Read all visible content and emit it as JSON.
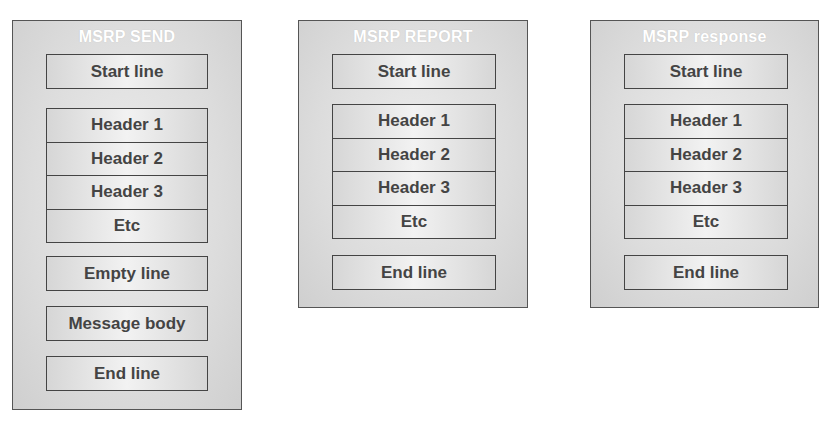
{
  "panels": [
    {
      "title": "MSRP SEND",
      "start_line": "Start line",
      "headers": [
        "Header 1",
        "Header 2",
        "Header 3",
        "Etc"
      ],
      "empty_line": "Empty line",
      "message_body": "Message body",
      "end_line": "End line"
    },
    {
      "title": "MSRP REPORT",
      "start_line": "Start line",
      "headers": [
        "Header 1",
        "Header 2",
        "Header 3",
        "Etc"
      ],
      "end_line": "End line"
    },
    {
      "title": "MSRP response",
      "start_line": "Start line",
      "headers": [
        "Header 1",
        "Header 2",
        "Header 3",
        "Etc"
      ],
      "end_line": "End line"
    }
  ]
}
